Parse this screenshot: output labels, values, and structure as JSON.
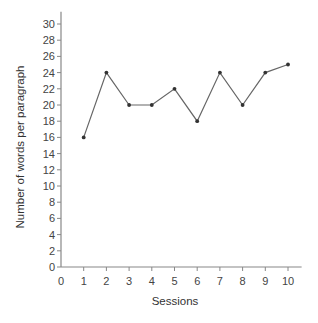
{
  "chart_data": {
    "type": "line",
    "title": "",
    "xlabel": "Sessions",
    "ylabel": "Number of words per paragraph",
    "x": [
      1,
      2,
      3,
      4,
      5,
      6,
      7,
      8,
      9,
      10
    ],
    "series": [
      {
        "name": "Words per paragraph",
        "values": [
          16,
          24,
          20,
          20,
          22,
          18,
          24,
          20,
          24,
          25
        ]
      }
    ],
    "x_ticks": [
      0,
      1,
      2,
      3,
      4,
      5,
      6,
      7,
      8,
      9,
      10
    ],
    "y_ticks": [
      0,
      2,
      4,
      6,
      8,
      10,
      12,
      14,
      16,
      18,
      20,
      22,
      24,
      26,
      28,
      30
    ],
    "xlim": [
      0,
      10.6
    ],
    "ylim": [
      0,
      31.5
    ],
    "grid": false,
    "legend": "none",
    "colors": {
      "line": "#666666",
      "marker": "#333333",
      "axis": "#888888"
    }
  }
}
